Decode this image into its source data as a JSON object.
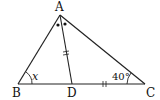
{
  "figure": {
    "type": "geometry-triangle",
    "points": {
      "A": {
        "label": "A",
        "x": 60,
        "y": 15
      },
      "B": {
        "label": "B",
        "x": 18,
        "y": 84
      },
      "C": {
        "label": "C",
        "x": 145,
        "y": 84
      },
      "D": {
        "label": "D",
        "x": 72,
        "y": 84
      }
    },
    "segments": [
      "AB",
      "AC",
      "BC",
      "AD"
    ],
    "angle_labels": {
      "B": "x",
      "C": "40°"
    },
    "equal_marks": {
      "AD": "||",
      "DC": "||"
    },
    "angle_bisector_marks": "••",
    "stroke_color": "#222222"
  }
}
